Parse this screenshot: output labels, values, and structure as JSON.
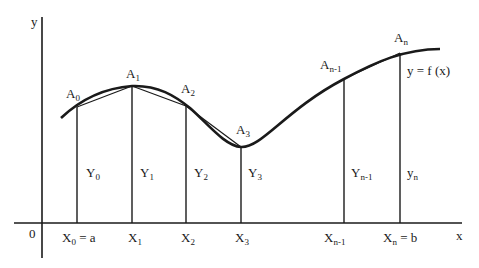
{
  "diagram": {
    "axes": {
      "x_label": "x",
      "y_label": "y",
      "origin_label": "0"
    },
    "curve_label": "y = f (x)",
    "points": [
      {
        "name": "A",
        "sub": "0",
        "x_name": "X",
        "x_sub": "0",
        "x_suffix": " = a",
        "y_name": "Y",
        "y_sub": "0"
      },
      {
        "name": "A",
        "sub": "1",
        "x_name": "X",
        "x_sub": "1",
        "x_suffix": "",
        "y_name": "Y",
        "y_sub": "1"
      },
      {
        "name": "A",
        "sub": "2",
        "x_name": "X",
        "x_sub": "2",
        "x_suffix": "",
        "y_name": "Y",
        "y_sub": "2"
      },
      {
        "name": "A",
        "sub": "3",
        "x_name": "X",
        "x_sub": "3",
        "x_suffix": "",
        "y_name": "Y",
        "y_sub": "3"
      },
      {
        "name": "A",
        "sub": "n-1",
        "x_name": "X",
        "x_sub": "n-1",
        "x_suffix": "",
        "y_name": "Y",
        "y_sub": "n-1"
      },
      {
        "name": "A",
        "sub": "n",
        "x_name": "X",
        "x_sub": "n",
        "x_suffix": " = b",
        "y_name": "y",
        "y_sub": "n"
      }
    ],
    "colors": {
      "ink": "#1a1a1a",
      "background": "#ffffff"
    }
  }
}
